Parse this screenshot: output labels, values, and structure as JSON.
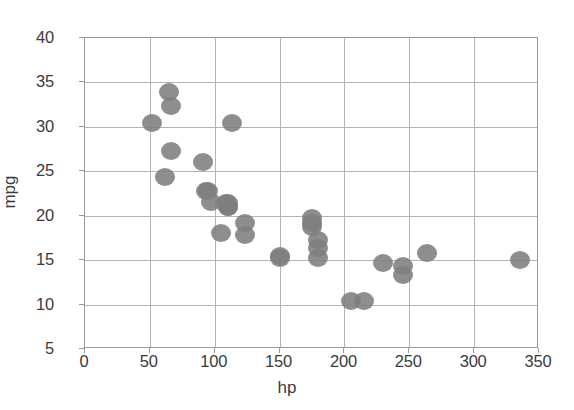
{
  "chart_data": {
    "type": "scatter",
    "title": "",
    "xlabel": "hp",
    "ylabel": "mpg",
    "xlim": [
      0,
      350
    ],
    "ylim": [
      5,
      40
    ],
    "xticks": [
      0,
      50,
      100,
      150,
      200,
      250,
      300,
      350
    ],
    "yticks": [
      5,
      10,
      15,
      20,
      25,
      30,
      35,
      40
    ],
    "xtick_labels": [
      "0",
      "50",
      "100",
      "150",
      "200",
      "250",
      "300",
      "350"
    ],
    "ytick_labels": [
      "5",
      "10",
      "15",
      "20",
      "25",
      "30",
      "35",
      "40"
    ],
    "grid": true,
    "legend": null,
    "marker": {
      "shape": "circle",
      "color": "#7e7e7e",
      "edge_color": "#6e6e6e",
      "size": 20,
      "opacity": 0.88
    },
    "series": [
      {
        "name": "cars",
        "x": [
          110,
          110,
          93,
          110,
          175,
          105,
          245,
          62,
          95,
          123,
          123,
          180,
          180,
          180,
          205,
          215,
          230,
          66,
          52,
          65,
          97,
          150,
          150,
          245,
          175,
          66,
          91,
          113,
          264,
          175,
          335,
          109
        ],
        "y": [
          21.0,
          21.0,
          22.8,
          21.4,
          18.7,
          18.1,
          14.3,
          24.4,
          22.8,
          19.2,
          17.8,
          16.4,
          17.3,
          15.2,
          10.4,
          10.4,
          14.7,
          32.4,
          30.4,
          33.9,
          21.5,
          15.5,
          15.2,
          13.3,
          19.2,
          27.3,
          26.0,
          30.4,
          15.8,
          19.7,
          15.0,
          21.4
        ]
      }
    ]
  },
  "axes": {
    "x_title": "hp",
    "y_title": "mpg"
  }
}
